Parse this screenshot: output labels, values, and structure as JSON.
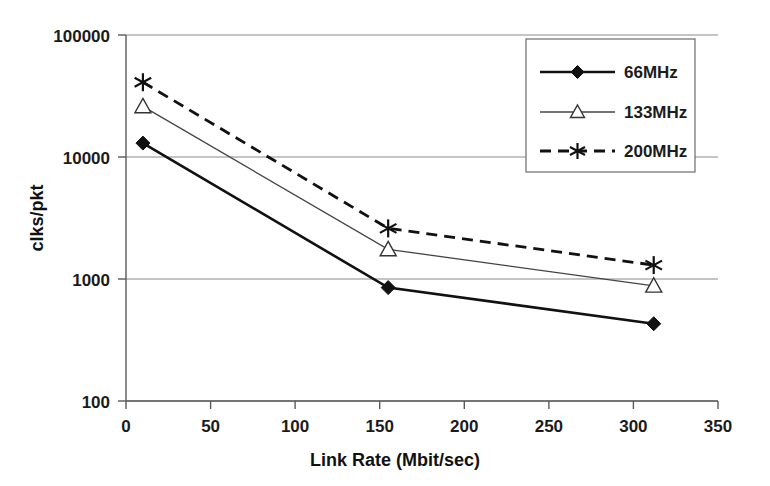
{
  "chart_data": {
    "type": "line",
    "title": "",
    "xlabel": "Link Rate (Mbit/sec)",
    "ylabel": "clks/pkt",
    "xlim": [
      0,
      350
    ],
    "ylim": [
      100,
      100000
    ],
    "yscale": "log",
    "grid": true,
    "legend_position": "top-right",
    "x": [
      10,
      155,
      312
    ],
    "xticks": [
      "0",
      "50",
      "100",
      "150",
      "200",
      "250",
      "300",
      "350"
    ],
    "xtick_values": [
      0,
      50,
      100,
      150,
      200,
      250,
      300,
      350
    ],
    "yticks": [
      "100",
      "1000",
      "10000",
      "100000"
    ],
    "ytick_values": [
      100,
      1000,
      10000,
      100000
    ],
    "series": [
      {
        "name": "66MHz",
        "marker": "filled-diamond",
        "line": "solid-thick",
        "values": [
          13000,
          850,
          430
        ]
      },
      {
        "name": "133MHz",
        "marker": "open-triangle",
        "line": "solid-thin",
        "values": [
          26000,
          1750,
          880
        ]
      },
      {
        "name": "200MHz",
        "marker": "asterisk",
        "line": "dashed",
        "values": [
          41000,
          2600,
          1300
        ]
      }
    ]
  },
  "axes": {
    "x_title": "Link Rate (Mbit/sec)",
    "y_title": "clks/pkt",
    "y_tick_100000": "100000",
    "y_tick_10000": "10000",
    "y_tick_1000": "1000",
    "y_tick_100": "100",
    "x_tick_0": "0",
    "x_tick_50": "50",
    "x_tick_100": "100",
    "x_tick_150": "150",
    "x_tick_200": "200",
    "x_tick_250": "250",
    "x_tick_300": "300",
    "x_tick_350": "350"
  },
  "legend": {
    "entries": [
      {
        "label": "66MHz"
      },
      {
        "label": "133MHz"
      },
      {
        "label": "200MHz"
      }
    ]
  },
  "colors": {
    "series_66": "#111111",
    "series_133": "#444444",
    "series_200": "#111111",
    "grid": "#8a8a8a",
    "axis": "#5a5a5a",
    "background": "#ffffff"
  }
}
